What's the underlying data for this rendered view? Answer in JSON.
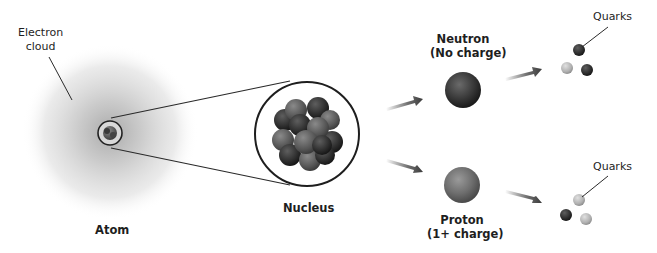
{
  "labels": {
    "electron_cloud_line1": "Electron",
    "electron_cloud_line2": "cloud",
    "atom": "Atom",
    "nucleus": "Nucleus",
    "neutron_line1": "Neutron",
    "neutron_line2": "(No charge)",
    "proton_line1": "Proton",
    "proton_line2": "(1+ charge)",
    "quarks_top": "Quarks",
    "quarks_bottom": "Quarks"
  },
  "diagram": {
    "nodes": [
      {
        "id": "atom",
        "label": "Atom",
        "shape": "fuzzy electron cloud with small circled nucleus"
      },
      {
        "id": "nucleus",
        "label": "Nucleus",
        "shape": "magnified circle containing cluster of spheres"
      },
      {
        "id": "neutron",
        "label": "Neutron (No charge)",
        "shape": "dark sphere"
      },
      {
        "id": "proton",
        "label": "Proton (1+ charge)",
        "shape": "medium-gray sphere"
      },
      {
        "id": "neutron_quarks",
        "label": "Quarks",
        "shape": "3 small spheres (2 dark, 1 light)"
      },
      {
        "id": "proton_quarks",
        "label": "Quarks",
        "shape": "3 small spheres (1 dark, 2 light)"
      }
    ],
    "edges": [
      {
        "from": "atom",
        "to": "nucleus",
        "type": "magnification lines"
      },
      {
        "from": "nucleus",
        "to": "neutron",
        "type": "arrow"
      },
      {
        "from": "nucleus",
        "to": "proton",
        "type": "arrow"
      },
      {
        "from": "neutron",
        "to": "neutron_quarks",
        "type": "arrow"
      },
      {
        "from": "proton",
        "to": "proton_quarks",
        "type": "arrow"
      }
    ]
  },
  "colors": {
    "text": "#1e1e1e",
    "line": "#2a2a2a",
    "cloud": "#b0b0b0",
    "neutron": "#3a3a3a",
    "proton": "#6e6e6e",
    "quark_dark": "#2b2b2b",
    "quark_light": "#b8b8b8"
  }
}
